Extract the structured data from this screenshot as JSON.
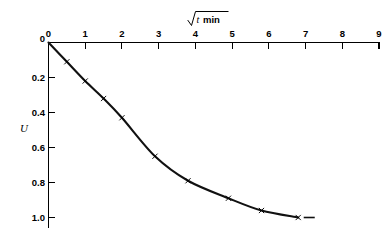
{
  "chart_data": {
    "type": "line",
    "title": "",
    "subtitle": "",
    "xlabel_parts": {
      "radical": "√",
      "variable": "t",
      "unit": "min"
    },
    "xlabel": "√t min",
    "ylabel": "U",
    "xlim": [
      0,
      9
    ],
    "ylim": [
      0,
      1.0
    ],
    "y_inverted": true,
    "grid": false,
    "legend": null,
    "x_ticks": [
      0,
      1,
      2,
      3,
      4,
      5,
      6,
      7,
      8,
      9
    ],
    "x_tick_labels": [
      "0",
      "1",
      "2",
      "3",
      "4",
      "5",
      "6",
      "7",
      "8",
      "9"
    ],
    "y_ticks": [
      0,
      0.2,
      0.4,
      0.6,
      0.8,
      1.0
    ],
    "y_tick_labels": [
      "0",
      "0.2",
      "0.4",
      "0.6",
      "0.8",
      "1.0"
    ],
    "marker": "x",
    "series": [
      {
        "name": "consolidation-curve",
        "x": [
          0.0,
          0.5,
          1.0,
          1.5,
          2.0,
          2.9,
          3.8,
          4.9,
          5.8,
          6.8
        ],
        "values": [
          0.0,
          0.11,
          0.22,
          0.32,
          0.43,
          0.65,
          0.79,
          0.89,
          0.96,
          1.0
        ]
      }
    ],
    "annotations": [
      {
        "name": "tail-dash",
        "x_start": 6.95,
        "x_end": 7.25,
        "y": 1.0
      }
    ]
  },
  "figure": {
    "background_color": "#ffffff",
    "line_color": "#111111",
    "axis_color": "#000000"
  }
}
